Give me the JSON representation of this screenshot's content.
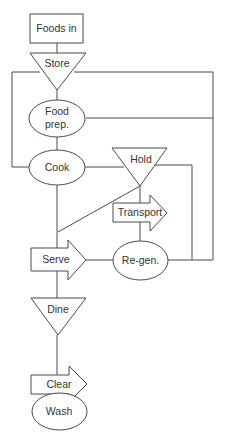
{
  "diagram": {
    "type": "process-flowchart",
    "colors": {
      "stroke": "#4a4a4a",
      "text": "#333333",
      "background": "#ffffff"
    },
    "nodes": [
      {
        "id": "foods_in",
        "label": "Foods in",
        "shape": "rectangle"
      },
      {
        "id": "store",
        "label": "Store",
        "shape": "inverted-triangle"
      },
      {
        "id": "food_prep",
        "label_line1": "Food",
        "label_line2": "prep.",
        "shape": "ellipse"
      },
      {
        "id": "cook",
        "label": "Cook",
        "shape": "ellipse"
      },
      {
        "id": "hold",
        "label": "Hold",
        "shape": "inverted-triangle"
      },
      {
        "id": "transport",
        "label": "Transport",
        "shape": "arrow"
      },
      {
        "id": "regen",
        "label": "Re-gen.",
        "shape": "ellipse"
      },
      {
        "id": "serve",
        "label": "Serve",
        "shape": "arrow"
      },
      {
        "id": "dine",
        "label": "Dine",
        "shape": "inverted-triangle"
      },
      {
        "id": "clear",
        "label": "Clear",
        "shape": "arrow"
      },
      {
        "id": "wash",
        "label": "Wash",
        "shape": "ellipse"
      }
    ],
    "edges": [
      [
        "foods_in",
        "store"
      ],
      [
        "store",
        "food_prep"
      ],
      [
        "store",
        "cook"
      ],
      [
        "store",
        "regen"
      ],
      [
        "food_prep",
        "cook"
      ],
      [
        "food_prep",
        "regen"
      ],
      [
        "cook",
        "hold"
      ],
      [
        "cook",
        "serve"
      ],
      [
        "hold",
        "serve"
      ],
      [
        "hold",
        "transport"
      ],
      [
        "hold",
        "regen"
      ],
      [
        "transport",
        "regen"
      ],
      [
        "regen",
        "serve"
      ],
      [
        "serve",
        "dine"
      ],
      [
        "dine",
        "clear"
      ],
      [
        "clear",
        "wash"
      ]
    ]
  }
}
